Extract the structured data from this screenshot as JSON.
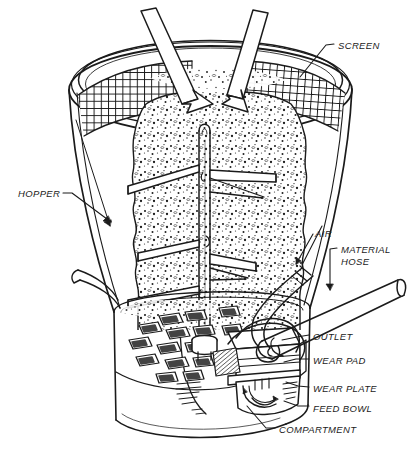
{
  "figure": {
    "kind": "technical-cutaway-diagram",
    "line_color": "#1b1b1b",
    "background_color": "#ffffff",
    "fill_pattern": "stippled granular abrasive media"
  },
  "labels": [
    {
      "id": "screen",
      "text": "SCREEN",
      "x": 338,
      "y": 40,
      "leader": "elbow-left-down"
    },
    {
      "id": "hopper",
      "text": "HOPPER",
      "x": 18,
      "y": 188,
      "leader": "elbow-right-down"
    },
    {
      "id": "air",
      "text": "AIR",
      "x": 315,
      "y": 228,
      "leader": "diagonal-down-left"
    },
    {
      "id": "material",
      "text": "MATERIAL",
      "x": 341,
      "y": 244,
      "leader": "elbow-left-down"
    },
    {
      "id": "hose",
      "text": "HOSE",
      "x": 341,
      "y": 256,
      "leader": "none"
    },
    {
      "id": "outlet",
      "text": "OUTLET",
      "x": 313,
      "y": 331,
      "leader": "dash-left"
    },
    {
      "id": "wear-pad",
      "text": "WEAR PAD",
      "x": 313,
      "y": 355,
      "leader": "dash-left"
    },
    {
      "id": "wear-plate",
      "text": "WEAR PLATE",
      "x": 313,
      "y": 383,
      "leader": "dash-left"
    },
    {
      "id": "feed-bowl",
      "text": "FEED BOWL",
      "x": 313,
      "y": 403,
      "leader": "dash-left"
    },
    {
      "id": "compartment",
      "text": "COMPARTMENT",
      "x": 279,
      "y": 424,
      "leader": "dash-left-up"
    }
  ],
  "caption": {
    "text": ""
  },
  "parts": [
    {
      "name": "screen",
      "description": "wire mesh grid covering hopper mouth, left and right sectors"
    },
    {
      "name": "hopper",
      "description": "inverted truncated cone holding abrasive media"
    },
    {
      "name": "inlet-arrows",
      "description": "two block arrows pointing down into the hopper mouth",
      "count": 2
    },
    {
      "name": "agitator-shaft",
      "description": "central vertical tube with cross paddles"
    },
    {
      "name": "agitator-paddles",
      "description": "angled cross bars on the shaft",
      "count": 4
    },
    {
      "name": "feed-bowl",
      "description": "cylindrical bowl below hopper with radial pockets"
    },
    {
      "name": "compartments",
      "description": "radial pockets in the feed bowl",
      "count": 14
    },
    {
      "name": "wear-plate",
      "description": "plate under the feed bowl"
    },
    {
      "name": "wear-pad",
      "description": "pad between bowl and outlet block"
    },
    {
      "name": "outlet",
      "description": "discharge block at bowl edge"
    },
    {
      "name": "air-hose",
      "description": "flexible hose entering the outlet block from upper right"
    },
    {
      "name": "material-hose",
      "description": "large straight hose leaving to the right"
    }
  ]
}
